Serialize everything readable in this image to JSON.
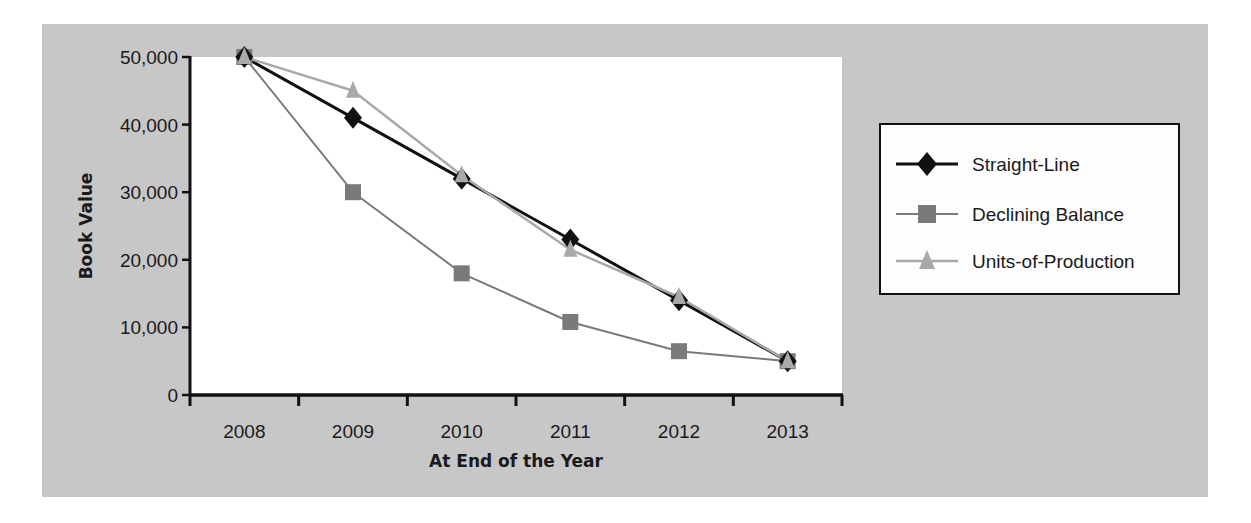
{
  "chart_data": {
    "type": "line",
    "title": "",
    "xlabel": "At End of the Year",
    "ylabel": "Book Value",
    "categories": [
      "2008",
      "2009",
      "2010",
      "2011",
      "2012",
      "2013"
    ],
    "ylim": [
      0,
      50000
    ],
    "yticks": [
      0,
      10000,
      20000,
      30000,
      40000,
      50000
    ],
    "ytick_labels": [
      "0",
      "10,000",
      "20,000",
      "30,000",
      "40,000",
      "50,000"
    ],
    "grid": false,
    "legend_position": "right",
    "series": [
      {
        "name": "Straight-Line",
        "marker": "diamond",
        "color": "#111111",
        "line_width": 3,
        "values": [
          50000,
          41000,
          32000,
          23000,
          14000,
          5000
        ]
      },
      {
        "name": "Declining Balance",
        "marker": "square",
        "color": "#7a7a7a",
        "line_width": 2,
        "values": [
          50000,
          30000,
          18000,
          10800,
          6480,
          5000
        ]
      },
      {
        "name": "Units-of-Production",
        "marker": "triangle",
        "color": "#a9a9a9",
        "line_width": 2.5,
        "values": [
          50000,
          45000,
          32500,
          21500,
          14500,
          5000
        ]
      }
    ]
  },
  "colors": {
    "panel_background": "#c7c7c7",
    "plot_background": "#ffffff",
    "axis": "#111111",
    "legend_border": "#111111",
    "legend_background": "#fdfdfd"
  }
}
